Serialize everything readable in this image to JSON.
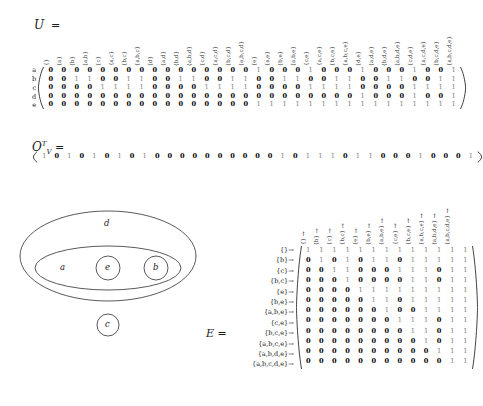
{
  "document": {
    "title": "Formal concept analysis matrices and Venn diagram"
  },
  "u_block": {
    "label": "U",
    "label_text": "U =",
    "row_labels": [
      "a",
      "b",
      "c",
      "d",
      "e"
    ],
    "col_headers": [
      "{}",
      "{a}",
      "{b}",
      "{a,b}",
      "{c}",
      "{a,c}",
      "{b,c}",
      "{a,b,c}",
      "{d}",
      "{a,d}",
      "{b,d}",
      "{a,b,d}",
      "{c,d}",
      "{a,c,d}",
      "{b,c,d}",
      "{a,b,c,d}",
      "{e}",
      "{a,e}",
      "{b,e}",
      "{a,b,e}",
      "{c,e}",
      "{a,c,e}",
      "{b,c,e}",
      "{a,b,c,e}",
      "{d,e}",
      "{a,d,e}",
      "{b,d,e}",
      "{a,b,d,e}",
      "{c,d,e}",
      "{a,c,d,e}",
      "{b,c,d,e}",
      "{a,b,c,d,e}"
    ],
    "rows": [
      [
        0,
        0,
        0,
        0,
        0,
        0,
        0,
        0,
        0,
        0,
        0,
        0,
        0,
        0,
        0,
        0,
        1,
        0,
        0,
        0,
        1,
        0,
        0,
        0,
        1,
        0,
        0,
        0,
        1,
        0,
        0,
        1
      ],
      [
        0,
        0,
        1,
        1,
        0,
        0,
        1,
        1,
        0,
        0,
        1,
        1,
        0,
        0,
        1,
        1,
        0,
        0,
        1,
        1,
        0,
        0,
        1,
        1,
        0,
        0,
        1,
        1,
        0,
        0,
        1,
        1
      ],
      [
        0,
        0,
        0,
        0,
        1,
        1,
        1,
        1,
        0,
        0,
        0,
        0,
        1,
        1,
        1,
        1,
        0,
        0,
        0,
        0,
        1,
        1,
        1,
        1,
        0,
        0,
        0,
        0,
        1,
        1,
        1,
        1
      ],
      [
        0,
        0,
        0,
        0,
        0,
        0,
        0,
        0,
        0,
        0,
        0,
        0,
        0,
        0,
        0,
        0,
        0,
        0,
        0,
        0,
        0,
        0,
        0,
        0,
        1,
        0,
        0,
        0,
        1,
        0,
        0,
        1
      ],
      [
        0,
        0,
        0,
        0,
        0,
        0,
        0,
        0,
        0,
        0,
        0,
        0,
        0,
        0,
        0,
        0,
        1,
        1,
        1,
        1,
        1,
        1,
        1,
        1,
        1,
        1,
        1,
        1,
        1,
        1,
        1,
        1
      ]
    ]
  },
  "ov_block": {
    "label_text": "O",
    "label_sub": "V",
    "label_sup": "T",
    "label_eq": "=",
    "values": [
      1,
      0,
      1,
      0,
      1,
      0,
      1,
      0,
      1,
      0,
      0,
      0,
      0,
      0,
      0,
      0,
      0,
      0,
      0,
      1,
      0,
      1,
      1,
      1,
      0,
      1,
      1,
      0,
      0,
      0,
      1,
      0,
      0,
      0,
      1
    ]
  },
  "venn": {
    "outer_label": "d",
    "mid_label": "a",
    "inner_left_label": "e",
    "inner_right_label": "b",
    "separate_label": "c"
  },
  "e_block": {
    "label_text": "E =",
    "col_headers": [
      "{}",
      "{b}",
      "{c}",
      "{b,c}",
      "{e}",
      "{b,e}",
      "{a,b,e}",
      "{c,e}",
      "{b,c,e}",
      "{a,b,c,e}",
      "{a,b,d,e}",
      "{a,b,c,d,e}"
    ],
    "row_labels": [
      "{}",
      "{b}",
      "{c}",
      "{b,c}",
      "{e}",
      "{b,e}",
      "{a,b,e}",
      "{c,e}",
      "{b,c,e}",
      "{a,b,c,e}",
      "{a,b,d,e}",
      "{a,b,c,d,e}"
    ],
    "arrow": "↑",
    "row_arrow": "→",
    "rows": [
      [
        1,
        1,
        1,
        1,
        1,
        1,
        1,
        1,
        1,
        1,
        1,
        1,
        1
      ],
      [
        0,
        1,
        0,
        1,
        0,
        1,
        1,
        0,
        1,
        1,
        1,
        1,
        1
      ],
      [
        0,
        0,
        1,
        1,
        0,
        0,
        0,
        1,
        1,
        1,
        0,
        1,
        1
      ],
      [
        0,
        0,
        0,
        1,
        0,
        0,
        0,
        0,
        1,
        1,
        0,
        1,
        1
      ],
      [
        0,
        0,
        0,
        0,
        1,
        1,
        1,
        1,
        1,
        1,
        1,
        1,
        1
      ],
      [
        0,
        0,
        0,
        0,
        0,
        1,
        1,
        0,
        1,
        1,
        1,
        1,
        1
      ],
      [
        0,
        0,
        0,
        0,
        0,
        0,
        1,
        0,
        0,
        1,
        1,
        1,
        1
      ],
      [
        0,
        0,
        0,
        0,
        0,
        0,
        0,
        1,
        1,
        1,
        0,
        1,
        1
      ],
      [
        0,
        0,
        0,
        0,
        0,
        0,
        0,
        0,
        1,
        1,
        0,
        1,
        1
      ],
      [
        0,
        0,
        0,
        0,
        0,
        0,
        0,
        0,
        0,
        1,
        0,
        1,
        1
      ],
      [
        0,
        0,
        0,
        0,
        0,
        0,
        0,
        0,
        0,
        0,
        1,
        1,
        1
      ],
      [
        0,
        0,
        0,
        0,
        0,
        0,
        0,
        0,
        0,
        0,
        0,
        1,
        1
      ]
    ]
  }
}
